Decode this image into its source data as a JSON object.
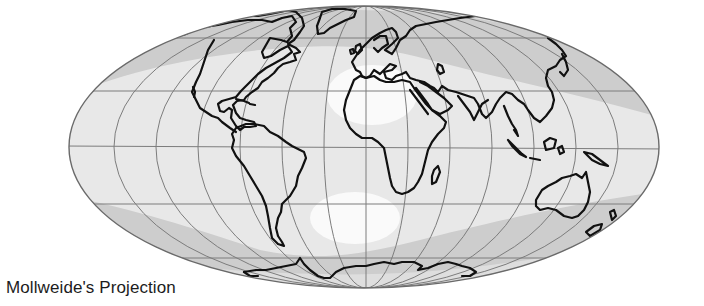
{
  "figure": {
    "caption": "Mollweide's Projection",
    "projection": "Mollweide",
    "colors": {
      "background": "#ffffff",
      "ocean_light": "#e9e9e9",
      "ocean_band": "#cfcfcf",
      "highlight": "#f7f7f7",
      "graticule": "#7a7a7a",
      "coastline": "#111111"
    },
    "graticule": {
      "parallels": 5,
      "meridians_per_side": 7
    },
    "continents": [
      "North America",
      "Greenland",
      "South America",
      "Europe",
      "Africa",
      "Madagascar",
      "Asia",
      "Arabia",
      "India",
      "Southeast Asia",
      "Indonesia",
      "New Guinea",
      "Australia",
      "New Zealand",
      "Antarctica",
      "British Isles",
      "Caribbean Islands",
      "Japan"
    ]
  }
}
